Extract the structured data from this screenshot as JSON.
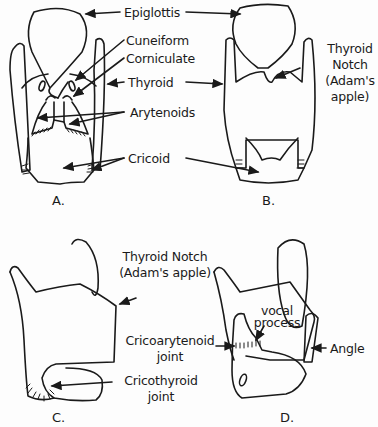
{
  "diagram": {
    "panels": [
      {
        "id": "A",
        "label": "A."
      },
      {
        "id": "B",
        "label": "B."
      },
      {
        "id": "C",
        "label": "C."
      },
      {
        "id": "D",
        "label": "D."
      }
    ],
    "labels": {
      "epiglottis": "Epiglottis",
      "cuneiform": "Cuneiform",
      "corniculate": "Corniculate",
      "thyroid": "Thyroid",
      "arytenoids": "Arytenoids",
      "cricoid": "Cricoid",
      "thyroid_notch_b_1": "Thyroid",
      "thyroid_notch_b_2": "Notch",
      "thyroid_notch_b_3": "(Adam's",
      "thyroid_notch_b_4": "apple)",
      "thyroid_notch_c_1": "Thyroid Notch",
      "thyroid_notch_c_2": "(Adam's apple)",
      "cricoarytenoid_1": "Cricoarytenoid",
      "cricoarytenoid_2": "joint",
      "cricothyroid_1": "Cricothyroid",
      "cricothyroid_2": "joint",
      "vocal_process_1": "vocal",
      "vocal_process_2": "process",
      "angle": "Angle"
    },
    "colors": {
      "ink": "#1a1a1a",
      "background": "#fdfdfd"
    }
  }
}
